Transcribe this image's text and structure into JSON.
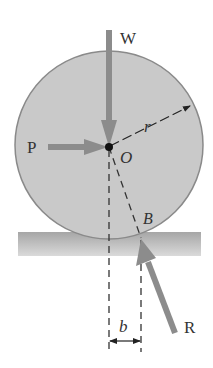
{
  "diagram": {
    "type": "free-body diagram",
    "labels": {
      "weight": "W",
      "push_force": "P",
      "center": "O",
      "radius": "r",
      "contact_point": "B",
      "reaction": "R",
      "offset": "b"
    },
    "colors": {
      "wheel_fill": "#c8c8c8",
      "wheel_edge": "#8a8a8a",
      "arrow": "#8c8c8c",
      "ground_top": "#a8a8a8",
      "ground_bottom": "#d8d8d8",
      "dashed": "#333333",
      "text": "#333333"
    }
  }
}
